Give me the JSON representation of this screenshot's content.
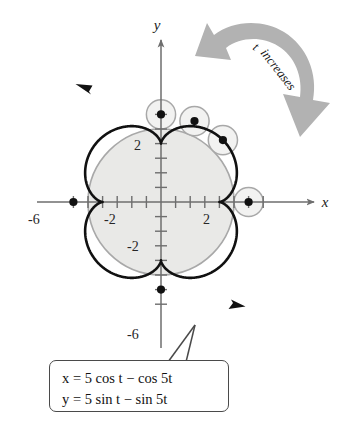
{
  "figure": {
    "kind": "parametric-curve-plot"
  },
  "axes": {
    "x_label": "x",
    "y_label": "y",
    "x_tick_labels": [
      "-6",
      "-2",
      "2"
    ],
    "y_tick_labels": [
      "2",
      "-2",
      "-6"
    ],
    "x_ticks": [
      -6,
      -5,
      -4,
      -3,
      -2,
      -1,
      1,
      2,
      3,
      4,
      5,
      6,
      7
    ],
    "y_ticks": [
      -7,
      -6,
      -5,
      -4,
      -3,
      -2,
      -1,
      1,
      2,
      3,
      4,
      5,
      6
    ],
    "origin_px": [
      161,
      202
    ],
    "unit_px": 14.6,
    "x_range": [
      -8.5,
      10.5
    ],
    "y_range": [
      -9.5,
      9.5
    ]
  },
  "annotation": {
    "rotation_arrow_label": "t increases",
    "rotation_direction": "counterclockwise"
  },
  "equation_box": {
    "line1": {
      "lhs": "x",
      "eq": "=",
      "rhs": "5 cos t − cos 5t",
      "full": "x = 5 cos t − cos 5t"
    },
    "line2": {
      "lhs": "y",
      "eq": "=",
      "rhs": "5 sin t − sin 5t",
      "full": "y = 5 sin t − sin 5t"
    }
  },
  "colors": {
    "curve": "#111111",
    "axis": "#6e6e6e",
    "fixed_circle_stroke": "#a8a8a8",
    "fixed_circle_fill": "#e9e9e7",
    "rolling_circle_stroke": "#a8a8a8",
    "rolling_circle_fill": "#eeeeec",
    "arrow_band": "#b2b2b2",
    "box_border": "#4a4a4a",
    "text": "#111111"
  },
  "chart_data": {
    "type": "line",
    "title": "",
    "xlabel": "x",
    "ylabel": "y",
    "grid": false,
    "legend": "none",
    "xlim": [
      -8.5,
      10.5
    ],
    "ylim": [
      -9.5,
      9.5
    ],
    "parametric": {
      "x_expression": "x = 5 cos t - cos 5t",
      "y_expression": "y = 5 sin t - sin 5t",
      "t_range": [
        0,
        6.283185307179586
      ],
      "direction": "counterclockwise"
    },
    "fixed_circle": {
      "center": [
        0,
        0
      ],
      "radius": 5
    },
    "rolling_circle": {
      "radius": 1,
      "count_shown": 4
    },
    "rolling_circle_centers": [
      [
        6,
        0
      ],
      [
        4.2426,
        4.2426
      ],
      [
        2.2961,
        5.5433
      ],
      [
        0,
        6
      ]
    ],
    "cusps": [
      [
        6,
        0
      ],
      [
        0,
        6
      ],
      [
        -6,
        0
      ],
      [
        0,
        -6
      ]
    ],
    "marked_points": [
      [
        6,
        0
      ],
      [
        4.2426,
        4.2426
      ],
      [
        2.2961,
        5.5433
      ],
      [
        0,
        6
      ],
      [
        -6,
        0
      ],
      [
        0,
        -6
      ]
    ],
    "x_ticks": [
      -6,
      -2,
      2
    ],
    "y_ticks": [
      2,
      -2,
      -6
    ]
  }
}
